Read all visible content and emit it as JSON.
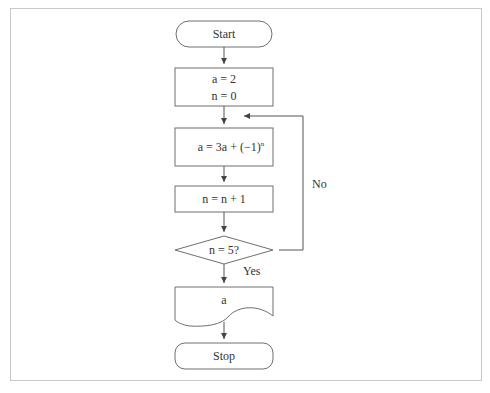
{
  "diagram": {
    "type": "flowchart",
    "nodes": {
      "start": {
        "shape": "terminal",
        "label": "Start"
      },
      "init": {
        "shape": "process",
        "line1": "a = 2",
        "line2": "n = 0"
      },
      "update_a": {
        "shape": "process",
        "label_main": "a = 3a + (−1)",
        "label_sup": "n"
      },
      "increment_n": {
        "shape": "process",
        "label": "n = n + 1"
      },
      "decision": {
        "shape": "decision",
        "label": "n = 5?"
      },
      "output": {
        "shape": "document",
        "label": "a"
      },
      "stop": {
        "shape": "terminal",
        "label": "Stop"
      }
    },
    "edges": {
      "yes_label": "Yes",
      "no_label": "No"
    },
    "colors": {
      "stroke": "#6e6e6e",
      "text": "#333333",
      "frame": "#c8c8c8"
    }
  }
}
